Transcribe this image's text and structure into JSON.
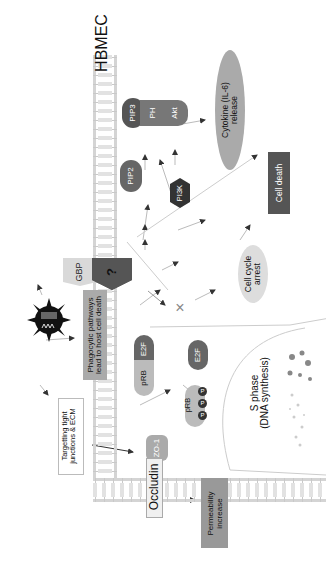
{
  "diagram": {
    "cell_label": "HBMEC",
    "membrane_proteins": {
      "receptor": "?",
      "gbp": "GBP",
      "occludin": "Occludin",
      "zo1": "ZO-1"
    },
    "signaling": {
      "pip2": "PIP2",
      "pip3": "PIP3",
      "ph": "PH",
      "akt": "Akt",
      "pi3k": "PI3K",
      "cytokine_line1": "Cytokine (IL-6)",
      "cytokine_line2": "release"
    },
    "outcomes": {
      "cell_death": "Cell  death",
      "cell_cycle_line1": "Cell  cycle",
      "cell_cycle_line2": "arrest",
      "phagocytic_line1": "Phagocytic pathways",
      "phagocytic_line2": "lead to host cell death",
      "targeting_line1": "Targetting tight",
      "targeting_line2": "junctions & ECM",
      "permeability_line1": "Permeability",
      "permeability_line2": "increase",
      "block_mark": "×"
    },
    "cell_cycle": {
      "prb": "pRB",
      "e2f": "E2F",
      "phospho": "P",
      "s_phase_line1": "S phase",
      "s_phase_line2": "(DNA synthesis)"
    },
    "colors": {
      "dark": "#444444",
      "medium": "#777777",
      "light": "#bdbdbd",
      "pale": "#d9d9d9",
      "arrow": "#333333"
    }
  }
}
